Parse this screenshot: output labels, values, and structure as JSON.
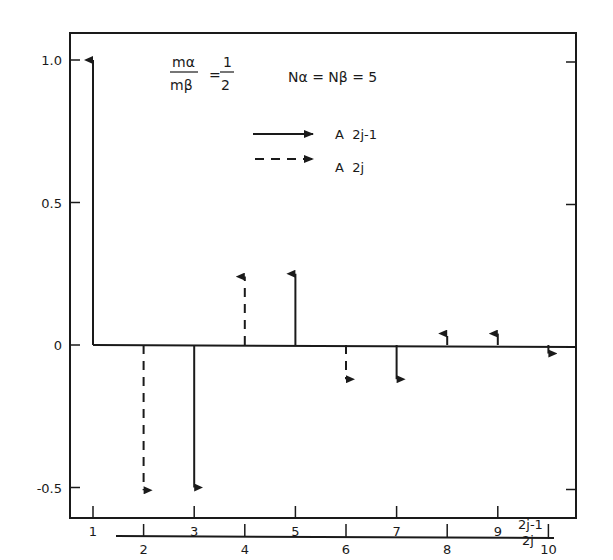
{
  "chart_data": {
    "type": "stem",
    "title": "",
    "annotations": {
      "mass_ratio_num": "mα",
      "mass_ratio_den": "mβ",
      "mass_ratio_eq": "=",
      "mass_ratio_value_num": "1",
      "mass_ratio_value_den": "2",
      "n_label": "Nα = Nβ = 5"
    },
    "legend": [
      {
        "style": "solid",
        "label": "A  2j-1"
      },
      {
        "style": "dashed",
        "label": "A  2j"
      }
    ],
    "yaxis": {
      "ticks": [
        "1.0",
        "0.5",
        "0",
        "-0.5"
      ],
      "tick_values": [
        1.0,
        0.5,
        0,
        -0.5
      ],
      "ylim": [
        -0.6,
        1.1
      ]
    },
    "xaxis_odd": {
      "label": "2j-1",
      "ticks": [
        "1",
        "3",
        "5",
        "7",
        "9"
      ]
    },
    "xaxis_even": {
      "label": "2j",
      "ticks": [
        "2",
        "4",
        "6",
        "8",
        "10"
      ]
    },
    "series": [
      {
        "name": "A 2j-1",
        "style": "solid",
        "x": [
          1,
          3,
          5,
          7,
          9
        ],
        "values": [
          1.0,
          -0.5,
          0.25,
          -0.12,
          0.04
        ]
      },
      {
        "name": "A 2j",
        "style": "dashed",
        "x": [
          2,
          4,
          6,
          8,
          10
        ],
        "values": [
          -0.51,
          0.24,
          -0.12,
          0.04,
          -0.03
        ]
      }
    ]
  }
}
